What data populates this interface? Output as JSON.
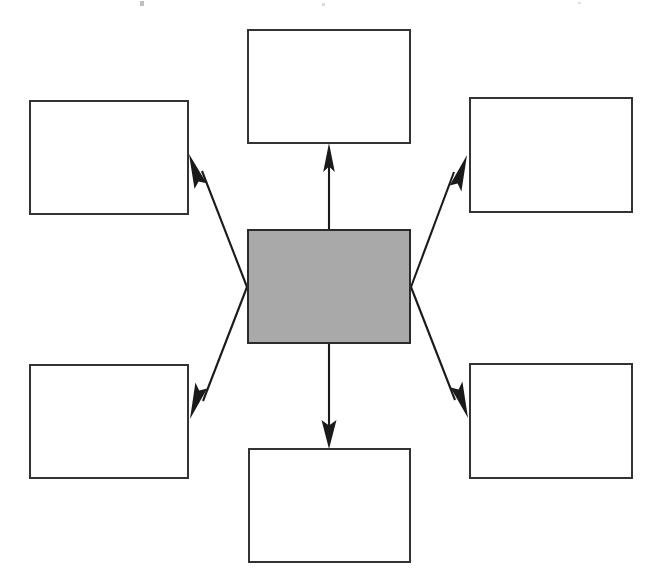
{
  "diagram": {
    "title": "",
    "type": "hub-and-spoke concept map",
    "canvas": {
      "width": 658,
      "height": 586,
      "background": "#ffffff"
    },
    "colors": {
      "center_fill": "#a9a9a9",
      "node_fill": "#ffffff",
      "stroke": "#333333",
      "arrow": "#1a1a1a"
    },
    "center": {
      "id": "center",
      "label": "",
      "x": 247,
      "y": 229,
      "width": 164,
      "height": 115,
      "fill": "#a9a9a9"
    },
    "nodes": [
      {
        "id": "top",
        "label": "",
        "x": 247,
        "y": 29,
        "width": 164,
        "height": 115,
        "fill": "#ffffff"
      },
      {
        "id": "top-left",
        "label": "",
        "x": 29,
        "y": 100,
        "width": 160,
        "height": 115,
        "fill": "#ffffff"
      },
      {
        "id": "top-right",
        "label": "",
        "x": 469,
        "y": 97,
        "width": 164,
        "height": 116,
        "fill": "#ffffff"
      },
      {
        "id": "bottom-left",
        "label": "",
        "x": 29,
        "y": 364,
        "width": 160,
        "height": 115,
        "fill": "#ffffff"
      },
      {
        "id": "bottom-right",
        "label": "",
        "x": 469,
        "y": 363,
        "width": 164,
        "height": 116,
        "fill": "#ffffff"
      },
      {
        "id": "bottom",
        "label": "",
        "x": 248,
        "y": 448,
        "width": 163,
        "height": 115,
        "fill": "#ffffff"
      }
    ],
    "connectors": [
      {
        "id": "center-to-top",
        "from": "center",
        "to": "top",
        "direction": "up",
        "arrowhead": "end"
      },
      {
        "id": "center-to-bottom",
        "from": "center",
        "to": "bottom",
        "direction": "down",
        "arrowhead": "end"
      },
      {
        "id": "center-to-top-left",
        "from": "center",
        "to": "top-left",
        "direction": "up-left",
        "arrowhead": "end"
      },
      {
        "id": "center-to-top-right",
        "from": "center",
        "to": "top-right",
        "direction": "up-right",
        "arrowhead": "end"
      },
      {
        "id": "center-to-bottom-left",
        "from": "center",
        "to": "bottom-left",
        "direction": "down-left",
        "arrowhead": "end"
      },
      {
        "id": "center-to-bottom-right",
        "from": "center",
        "to": "bottom-right",
        "direction": "down-right",
        "arrowhead": "end"
      }
    ]
  }
}
